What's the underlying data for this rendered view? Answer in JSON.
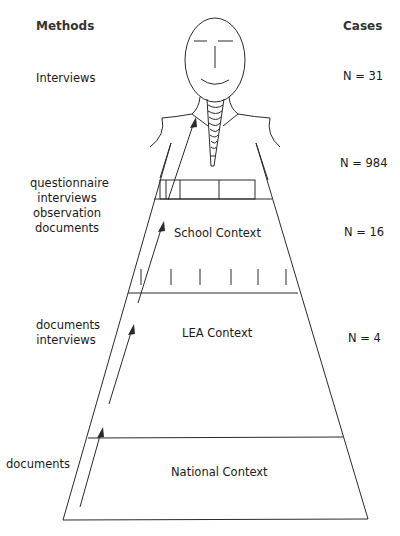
{
  "headers": {
    "methods": "Methods",
    "cases": "Cases"
  },
  "levels": [
    {
      "id": "individual",
      "methods": [
        "Interviews"
      ],
      "cases": "N = 31"
    },
    {
      "id": "classroom",
      "methods": [],
      "cases": "N = 984"
    },
    {
      "id": "school",
      "context_label": "School Context",
      "methods": [
        "questionnaire",
        "interviews",
        "observation",
        "documents"
      ],
      "cases": "N = 16"
    },
    {
      "id": "lea",
      "context_label": "LEA Context",
      "methods": [
        "documents",
        "interviews"
      ],
      "cases": "N = 4"
    },
    {
      "id": "national",
      "context_label": "National Context",
      "methods": [
        "documents"
      ],
      "cases": ""
    }
  ],
  "colors": {
    "line": "#2a2a2a",
    "text": "#1a1a1a",
    "background": "#ffffff"
  }
}
